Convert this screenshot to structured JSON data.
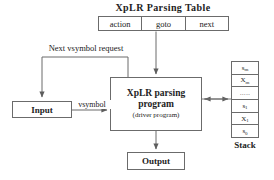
{
  "diagram": {
    "title": "XpLR Parsing Table",
    "parsing_table": {
      "name": "XpLR Parsing Table",
      "columns": [
        "action",
        "goto",
        "next"
      ]
    },
    "input": {
      "label": "Input"
    },
    "parser": {
      "line1": "XpLR  parsing",
      "line2": "program",
      "line3": "(driver program)"
    },
    "output": {
      "label": "Output"
    },
    "stack": {
      "label": "Stack",
      "cells": [
        "sm",
        "Xm",
        "…..",
        "s1",
        "X1",
        "s0"
      ],
      "cells_display": [
        {
          "base": "s",
          "sub": "m"
        },
        {
          "base": "X",
          "sub": "m"
        },
        {
          "base": "…..",
          "sub": ""
        },
        {
          "base": "s",
          "sub": "1"
        },
        {
          "base": "X",
          "sub": "1"
        },
        {
          "base": "s",
          "sub": "0"
        }
      ]
    },
    "edges": {
      "next_symbol_request": "Next vsymbol request",
      "vsymbol": "vsymbol"
    },
    "colors": {
      "stroke": "#6b6b6b",
      "text": "#222222",
      "background": "#ffffff"
    }
  }
}
